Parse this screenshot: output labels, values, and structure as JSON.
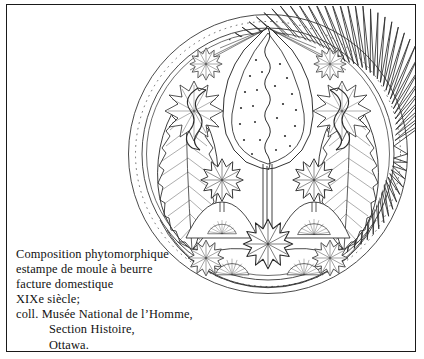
{
  "page": {
    "width": 424,
    "height": 359,
    "background_color": "#ffffff",
    "frame_color": "#1a1a1a",
    "ink_color": "#222222"
  },
  "illustration": {
    "name": "circular-butter-mold-stamp-drawing",
    "subject": "Composition phytomorphique",
    "technique": "line drawing",
    "shape": "circle",
    "center_x": 148,
    "center_y": 148,
    "radius": 140,
    "motifs": [
      "sawtooth outer rim",
      "central seed pod with dotted interior and wavy stem",
      "serrated feather leaves left and right",
      "flower rosettes",
      "fan-shaped blossoms",
      "mound bases",
      "concentric arc bands at base"
    ]
  },
  "caption": {
    "lines": [
      {
        "text": "Composition phytomorphique",
        "indent": false
      },
      {
        "text": "estampe de moule à beurre",
        "indent": false
      },
      {
        "text": "facture domestique",
        "indent": false
      },
      {
        "text": "XIXe siècle;",
        "indent": false
      },
      {
        "text": "coll. Musée National de l’Homme,",
        "indent": false
      },
      {
        "text": "Section Histoire,",
        "indent": true
      },
      {
        "text": "Ottawa.",
        "indent": true
      }
    ]
  }
}
